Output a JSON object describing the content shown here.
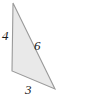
{
  "figure": {
    "kind": "geometry-diagram",
    "shape": "triangle",
    "background_color": "#ffffff",
    "fill_color": "#e9e9e9",
    "stroke_color": "#9a9a9a",
    "label_color": "#1a1a1a",
    "canvas": {
      "width": 94,
      "height": 104
    },
    "vertices": {
      "top": {
        "x": 13,
        "y": 3
      },
      "bottom_left": {
        "x": 12,
        "y": 71
      },
      "bottom_right": {
        "x": 55,
        "y": 89
      }
    },
    "labels": {
      "left_side": "4",
      "hypotenuse": "6",
      "base": "3"
    }
  }
}
